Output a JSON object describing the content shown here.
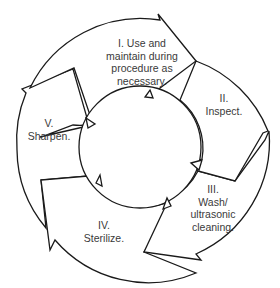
{
  "diagram": {
    "type": "cycle",
    "colors": {
      "stroke": "#1a1a1a",
      "fill": "#ffffff",
      "text": "#3a3a3a"
    },
    "steps": [
      {
        "id": "I",
        "lines": [
          "I. Use and",
          "maintain during",
          "procedure as",
          "necessary."
        ]
      },
      {
        "id": "II",
        "lines": [
          "II.",
          "Inspect."
        ]
      },
      {
        "id": "III",
        "lines": [
          "III.",
          "Wash/",
          "ultrasonic",
          "cleaning."
        ]
      },
      {
        "id": "IV",
        "lines": [
          "IV.",
          "Sterilize."
        ]
      },
      {
        "id": "V",
        "lines": [
          "V.",
          "Sharpen."
        ]
      }
    ]
  }
}
